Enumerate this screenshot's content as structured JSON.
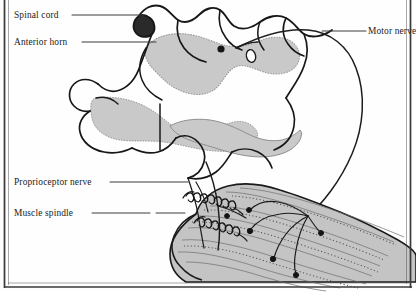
{
  "figure": {
    "frame": {
      "style": "page-border",
      "sides": [
        "left",
        "bottom"
      ],
      "color": "#3a3a3a"
    },
    "colors": {
      "background": "#fefefe",
      "ink": "#1a1a1a",
      "gray_matter": "#c9c9c9",
      "gray_matter_edge": "#9a9a9a",
      "muscle": "#c4c4c4",
      "muscle_edge": "#8d8d8d",
      "leader_line": "#3b3b3b",
      "text": "#1c1c1c"
    },
    "labels": [
      {
        "id": "spinal-cord",
        "text": "Spinal cord",
        "side": "left",
        "leader": {
          "from_x": 72,
          "from_y": 15,
          "to_x": 144,
          "to_y": 15
        }
      },
      {
        "id": "anterior-horn",
        "text": "Anterior horn",
        "side": "left",
        "leader": {
          "from_x": 82,
          "from_y": 42,
          "to_x": 156,
          "to_y": 42
        }
      },
      {
        "id": "proprioceptor-nerve",
        "text": "Proprioceptor nerve",
        "side": "left",
        "leader": {
          "from_x": 110,
          "from_y": 182,
          "to_x": 188,
          "to_y": 182
        }
      },
      {
        "id": "muscle-spindle",
        "text": "Muscle spindle",
        "side": "left",
        "leader": {
          "from_x": 92,
          "from_y": 213,
          "to_x": 185,
          "to_y": 213
        }
      },
      {
        "id": "motor-nerve",
        "text": "Motor nerve",
        "side": "right",
        "leader": {
          "from_x": 366,
          "from_y": 31,
          "to_x": 322,
          "to_y": 31
        }
      }
    ],
    "structures": [
      {
        "id": "white-matter-outline",
        "name": "spinal cord white matter outline"
      },
      {
        "id": "gray-matter",
        "name": "gray matter butterfly"
      },
      {
        "id": "motor-neuron-soma",
        "name": "motor neuron cell body"
      },
      {
        "id": "central-canal",
        "name": "central canal"
      },
      {
        "id": "motor-nerve-axon",
        "name": "motor nerve axon"
      },
      {
        "id": "proprioceptor-axon",
        "name": "proprioceptor sensory axon"
      },
      {
        "id": "muscle-body",
        "name": "skeletal muscle belly"
      },
      {
        "id": "muscle-spindle-1",
        "name": "muscle spindle coil upper"
      },
      {
        "id": "muscle-spindle-2",
        "name": "muscle spindle coil lower"
      },
      {
        "id": "motor-end-plates",
        "name": "motor nerve terminal endings"
      }
    ]
  }
}
